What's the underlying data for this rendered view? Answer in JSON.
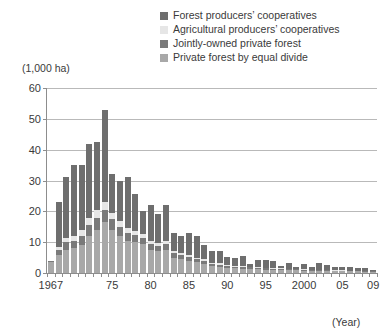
{
  "chart_data": {
    "type": "bar",
    "subtype": "stacked-bar",
    "title": "",
    "xlabel": "(Year)",
    "ylabel": "(1,000 ha)",
    "ylim": [
      0,
      60
    ],
    "yticks": [
      0,
      10,
      20,
      30,
      40,
      50,
      60
    ],
    "grid": true,
    "legend_position": "top-right",
    "xtick_labels": [
      "1967",
      "75",
      "80",
      "85",
      "90",
      "95",
      "2000",
      "05",
      "09"
    ],
    "xtick_years": [
      1967,
      1975,
      1980,
      1985,
      1990,
      1995,
      2000,
      2005,
      2009
    ],
    "categories": [
      "1967",
      "1968",
      "1969",
      "1970",
      "1971",
      "1972",
      "1973",
      "1974",
      "1975",
      "1976",
      "1977",
      "1978",
      "1979",
      "1980",
      "1981",
      "1982",
      "1983",
      "1984",
      "1985",
      "1986",
      "1987",
      "1988",
      "1989",
      "1990",
      "1991",
      "1992",
      "1993",
      "1994",
      "1995",
      "1996",
      "1997",
      "1998",
      "1999",
      "2000",
      "2001",
      "2002",
      "2003",
      "2004",
      "2005",
      "2006",
      "2007",
      "2008",
      "2009"
    ],
    "series": [
      {
        "name": "Private forest by equal divide",
        "color": "#a8a8a8",
        "values": [
          3.5,
          6.0,
          7.5,
          8.0,
          9.0,
          12.0,
          14.0,
          16.5,
          14.0,
          12.0,
          10.5,
          10.0,
          9.5,
          7.5,
          7.0,
          7.5,
          5.0,
          4.5,
          4.0,
          3.5,
          3.0,
          2.2,
          2.0,
          1.6,
          1.5,
          1.4,
          1.3,
          1.2,
          1.1,
          1.0,
          1.0,
          0.9,
          0.9,
          0.8,
          0.8,
          0.7,
          0.7,
          0.6,
          0.6,
          0.5,
          0.5,
          0.4,
          0.4
        ]
      },
      {
        "name": "Jointly-owned private forest",
        "color": "#7a7a7a",
        "values": [
          0.3,
          1.5,
          2.5,
          2.5,
          3.0,
          3.5,
          4.0,
          4.0,
          3.5,
          3.0,
          2.5,
          2.2,
          2.0,
          2.0,
          1.8,
          2.0,
          1.5,
          1.3,
          1.2,
          1.0,
          0.9,
          0.8,
          0.7,
          0.6,
          0.6,
          0.5,
          0.5,
          0.4,
          0.4,
          0.4,
          0.3,
          0.3,
          0.3,
          0.3,
          0.2,
          0.2,
          0.2,
          0.2,
          0.2,
          0.2,
          0.2,
          0.1,
          0.1
        ]
      },
      {
        "name": "Agricultural producers’ cooperatives",
        "color": "#e6e6e6",
        "values": [
          0.0,
          1.0,
          1.5,
          1.5,
          2.0,
          2.5,
          2.5,
          2.5,
          2.0,
          2.0,
          1.5,
          1.5,
          1.2,
          1.0,
          1.0,
          1.0,
          0.8,
          0.7,
          0.6,
          0.5,
          0.5,
          0.4,
          0.4,
          0.3,
          0.3,
          0.3,
          0.2,
          0.2,
          0.2,
          0.2,
          0.2,
          0.1,
          0.1,
          0.1,
          0.1,
          0.1,
          0.1,
          0.1,
          0.1,
          0.1,
          0.1,
          0.1,
          0.1
        ]
      },
      {
        "name": "Forest producers’ cooperatives",
        "color": "#6e6e6e",
        "values": [
          0.0,
          14.5,
          19.5,
          23.0,
          21.0,
          24.0,
          22.0,
          30.0,
          12.5,
          13.0,
          16.5,
          12.0,
          7.5,
          11.5,
          9.5,
          11.5,
          5.7,
          5.5,
          7.2,
          7.0,
          4.6,
          3.6,
          3.9,
          2.6,
          2.6,
          3.2,
          1.0,
          2.4,
          2.4,
          2.4,
          0.8,
          1.8,
          0.8,
          1.7,
          0.9,
          2.1,
          1.5,
          1.2,
          1.2,
          1.2,
          0.7,
          0.9,
          0.5
        ]
      }
    ],
    "totals": [
      3.8,
      23.0,
      31.0,
      35.0,
      35.0,
      42.0,
      42.5,
      53.0,
      32.0,
      30.0,
      31.0,
      25.7,
      20.2,
      22.0,
      19.3,
      22.0,
      13.0,
      12.0,
      13.0,
      12.0,
      9.0,
      7.0,
      7.0,
      5.1,
      5.0,
      5.4,
      3.0,
      4.2,
      4.1,
      4.0,
      2.3,
      3.1,
      2.1,
      2.9,
      2.0,
      3.1,
      2.5,
      2.1,
      2.1,
      2.0,
      1.5,
      1.5,
      1.1
    ]
  },
  "axes": {
    "unit_label": "(1,000 ha)",
    "year_note": "(Year)"
  },
  "legend": {
    "items": [
      {
        "label": "Forest producers’ cooperatives",
        "color": "#6e6e6e"
      },
      {
        "label": "Agricultural producers’ cooperatives",
        "color": "#e6e6e6"
      },
      {
        "label": "Jointly-owned private forest",
        "color": "#7a7a7a"
      },
      {
        "label": "Private forest by equal divide",
        "color": "#a8a8a8"
      }
    ]
  }
}
